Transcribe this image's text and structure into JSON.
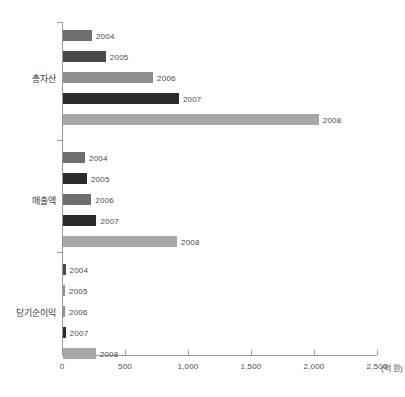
{
  "chart_data": {
    "type": "bar",
    "orientation": "horizontal",
    "title": "",
    "xlabel": "",
    "ylabel": "",
    "unit_label": "(억 원)",
    "xlim": [
      0,
      2500
    ],
    "grid": false,
    "legend": "none",
    "tick_labels": [
      "0",
      "500",
      "1,000",
      "1,500",
      "2,000",
      "2,500"
    ],
    "tick_values": [
      0,
      500,
      1000,
      1500,
      2000,
      2500
    ],
    "categories": [
      "총자산",
      "매출액",
      "당기순이익"
    ],
    "series": [
      {
        "name": "2004",
        "values": [
          230,
          175,
          20
        ],
        "color": "#6e6e6e"
      },
      {
        "name": "2005",
        "values": [
          340,
          190,
          12
        ],
        "color": "#4a4a4a"
      },
      {
        "name": "2006",
        "values": [
          715,
          225,
          10
        ],
        "color": "#8f8f8f"
      },
      {
        "name": "2007",
        "values": [
          920,
          265,
          22
        ],
        "color": "#2b2b2b"
      },
      {
        "name": "2008",
        "values": [
          2030,
          905,
          260
        ],
        "color": "#a8a8a8"
      }
    ],
    "bars": [
      {
        "category": "총자산",
        "year": "2004",
        "value": 230,
        "color": "#6e6e6e"
      },
      {
        "category": "총자산",
        "year": "2005",
        "value": 340,
        "color": "#4a4a4a"
      },
      {
        "category": "총자산",
        "year": "2006",
        "value": 715,
        "color": "#8f8f8f"
      },
      {
        "category": "총자산",
        "year": "2007",
        "value": 920,
        "color": "#2b2b2b"
      },
      {
        "category": "총자산",
        "year": "2008",
        "value": 2030,
        "color": "#a8a8a8"
      },
      {
        "category": "매출액",
        "year": "2004",
        "value": 175,
        "color": "#6e6e6e"
      },
      {
        "category": "매출액",
        "year": "2005",
        "value": 190,
        "color": "#2b2b2b"
      },
      {
        "category": "매출액",
        "year": "2006",
        "value": 225,
        "color": "#6e6e6e"
      },
      {
        "category": "매출액",
        "year": "2007",
        "value": 265,
        "color": "#2b2b2b"
      },
      {
        "category": "매출액",
        "year": "2008",
        "value": 905,
        "color": "#a8a8a8"
      },
      {
        "category": "당기순이익",
        "year": "2004",
        "value": 20,
        "color": "#4a4a4a"
      },
      {
        "category": "당기순이익",
        "year": "2005",
        "value": 12,
        "color": "#8f8f8f"
      },
      {
        "category": "당기순이익",
        "year": "2006",
        "value": 10,
        "color": "#8f8f8f"
      },
      {
        "category": "당기순이익",
        "year": "2007",
        "value": 22,
        "color": "#2b2b2b"
      },
      {
        "category": "당기순이익",
        "year": "2008",
        "value": 260,
        "color": "#a8a8a8"
      }
    ]
  }
}
